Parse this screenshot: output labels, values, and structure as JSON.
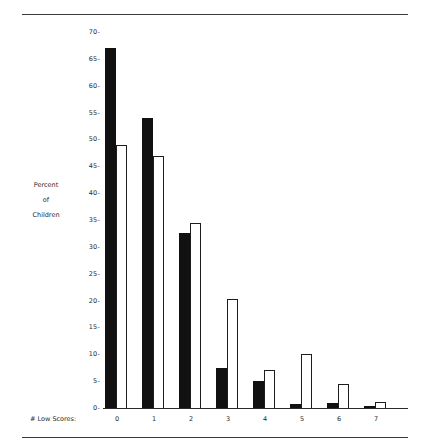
{
  "chart_data": {
    "type": "bar",
    "title": "",
    "subtitle": "",
    "xlabel": "# Low Scores:",
    "ylabel": "Percent of Children",
    "ylabel_lines": [
      "Percent",
      "of",
      "Children"
    ],
    "categories": [
      "0",
      "1",
      "2",
      "3",
      "4",
      "5",
      "6",
      "7"
    ],
    "series": [
      {
        "name": "dark",
        "style": "filled-black",
        "color": "#111111",
        "values": [
          67.0,
          54.0,
          32.5,
          7.5,
          5.0,
          0.8,
          0.9,
          0.2
        ]
      },
      {
        "name": "light",
        "style": "open-white",
        "color": "#ffffff",
        "edge_color": "#1d1d1d",
        "values": [
          49.0,
          47.0,
          34.5,
          20.3,
          7.1,
          10.0,
          4.4,
          1.2
        ]
      }
    ],
    "ylim": [
      0,
      70
    ],
    "yticks": [
      0,
      5,
      10,
      15,
      20,
      25,
      30,
      35,
      40,
      45,
      50,
      55,
      60,
      65,
      70
    ],
    "ytick_labels": [
      "0-",
      "5-",
      "10-",
      "15-",
      "20-",
      "25-",
      "30-",
      "35-",
      "40-",
      "45-",
      "50-",
      "55-",
      "60-",
      "65-",
      "70-"
    ],
    "grid": false,
    "legend": null,
    "legend_position": "none",
    "annotations": [],
    "rules": [
      "top-horizontal-rule",
      "bottom-horizontal-rule"
    ]
  }
}
